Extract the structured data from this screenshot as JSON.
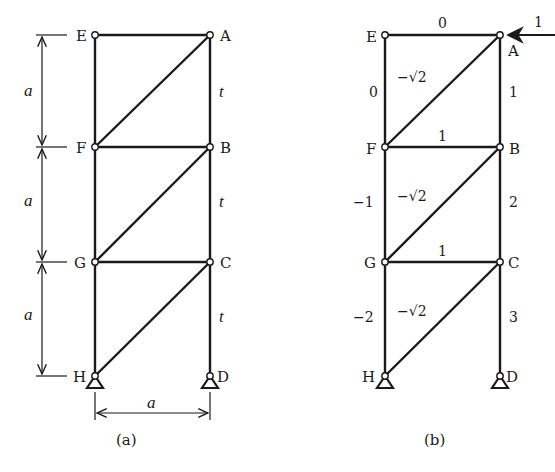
{
  "figure_a": {
    "caption": "(a)",
    "nodes": {
      "E": "E",
      "A": "A",
      "F": "F",
      "B": "B",
      "G": "G",
      "C": "C",
      "H": "H",
      "D": "D"
    },
    "dimension_labels": {
      "panel_1": "a",
      "panel_2": "a",
      "panel_3": "a",
      "width": "a"
    },
    "member_labels": {
      "AB": "t",
      "BC": "t",
      "CD": "t"
    }
  },
  "figure_b": {
    "caption": "(b)",
    "nodes": {
      "E": "E",
      "A": "A",
      "F": "F",
      "B": "B",
      "G": "G",
      "C": "C",
      "H": "H",
      "D": "D"
    },
    "load": {
      "value": "1",
      "direction": "left",
      "at": "A"
    },
    "member_forces": {
      "EA": "0",
      "EF": "0",
      "AF": "−√2",
      "AB": "1",
      "FB": "1",
      "FG": "−1",
      "BG": "−√2",
      "BC": "2",
      "GC": "1",
      "GH": "−2",
      "CH": "−√2",
      "CD": "3"
    }
  }
}
